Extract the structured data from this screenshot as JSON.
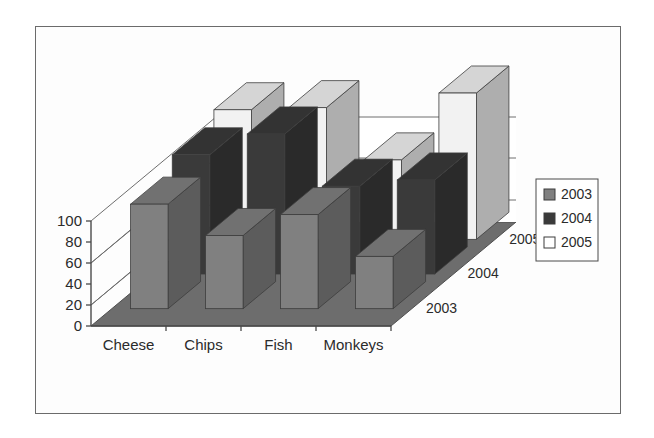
{
  "chart_data": {
    "type": "bar",
    "title": "",
    "subtitle": "",
    "xlabel": "",
    "ylabel": "",
    "zlabel": "",
    "projection": "3d-grouped-columns",
    "categories": [
      "Cheese",
      "Chips",
      "Fish",
      "Monkeys"
    ],
    "series": [
      {
        "name": "2003",
        "color": "#808080",
        "values": [
          50,
          35,
          45,
          25
        ]
      },
      {
        "name": "2004",
        "color": "#3a3a3a",
        "values": [
          57,
          67,
          42,
          45
        ]
      },
      {
        "name": "2005",
        "color": "#f2f2f2",
        "values": [
          62,
          63,
          38,
          70
        ]
      }
    ],
    "ytick_labels": [
      "0",
      "20",
      "40",
      "60",
      "80",
      "100"
    ],
    "ytick_values": [
      0,
      20,
      40,
      60,
      80,
      100
    ],
    "ylim": [
      0,
      100
    ],
    "grid": true,
    "gridline_values": [
      60,
      80,
      100
    ],
    "legend_position": "right",
    "legend_entries": [
      {
        "label": "2003",
        "swatch": "#808080"
      },
      {
        "label": "2004",
        "swatch": "#3a3a3a"
      },
      {
        "label": "2005",
        "swatch": "#ffffff"
      }
    ],
    "depth_axis_labels": [
      "2003",
      "2004",
      "2005"
    ]
  },
  "colors": {
    "frame_border": "#6b6b6b",
    "background": "#ffffff",
    "plot_background": "#fdfdfd",
    "floor": "#6d6d6d",
    "wall": "#ffffff",
    "axis": "#4a4a4a",
    "gridline": "#6e6e6e",
    "text": "#2b2b2b",
    "series_2003": "#808080",
    "series_2004": "#3a3a3a",
    "series_2005": "#f2f2f2"
  }
}
